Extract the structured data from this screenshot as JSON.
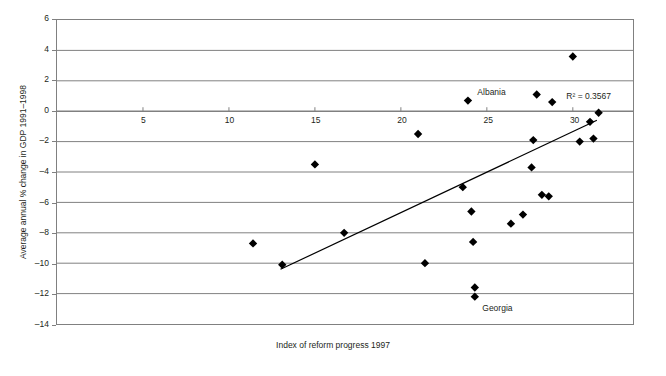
{
  "chart_data": {
    "type": "scatter",
    "title": "",
    "xlabel": "Index of reform progress 1997",
    "ylabel": "Average annual % change in GDP 1991–1998",
    "xlim": [
      0,
      33.5
    ],
    "ylim": [
      -14,
      6
    ],
    "xticks": [
      5,
      10,
      15,
      20,
      25,
      30
    ],
    "xtick_labels": [
      "5",
      "10",
      "15",
      "20",
      "25",
      "30"
    ],
    "yticks": [
      6,
      4,
      2,
      0,
      -2,
      -4,
      -6,
      -8,
      -10,
      -12,
      -14
    ],
    "ytick_labels": [
      "6",
      "4",
      "2",
      "0",
      "–2",
      "–4",
      "–6",
      "–8",
      "–10",
      "–12",
      "–14"
    ],
    "grid": "horizontal",
    "legend": "none",
    "marker": "diamond",
    "marker_color": "#000000",
    "grid_color": "#808080",
    "frame_color": "#808080",
    "points": [
      {
        "x": 11.4,
        "y": -8.7,
        "label": ""
      },
      {
        "x": 13.1,
        "y": -10.1,
        "label": ""
      },
      {
        "x": 15.0,
        "y": -3.5,
        "label": ""
      },
      {
        "x": 16.7,
        "y": -8.0,
        "label": ""
      },
      {
        "x": 21.0,
        "y": -1.5,
        "label": ""
      },
      {
        "x": 21.4,
        "y": -10.0,
        "label": ""
      },
      {
        "x": 23.6,
        "y": -5.0,
        "label": ""
      },
      {
        "x": 23.9,
        "y": 0.7,
        "label": "Albania"
      },
      {
        "x": 24.1,
        "y": -6.6,
        "label": ""
      },
      {
        "x": 24.2,
        "y": -8.6,
        "label": ""
      },
      {
        "x": 24.3,
        "y": -11.6,
        "label": ""
      },
      {
        "x": 24.3,
        "y": -12.2,
        "label": "Georgia"
      },
      {
        "x": 26.4,
        "y": -7.4,
        "label": ""
      },
      {
        "x": 27.1,
        "y": -6.8,
        "label": ""
      },
      {
        "x": 27.6,
        "y": -3.7,
        "label": ""
      },
      {
        "x": 27.7,
        "y": -1.9,
        "label": ""
      },
      {
        "x": 27.9,
        "y": 1.1,
        "label": ""
      },
      {
        "x": 28.2,
        "y": -5.5,
        "label": ""
      },
      {
        "x": 28.6,
        "y": -5.6,
        "label": ""
      },
      {
        "x": 28.8,
        "y": 0.6,
        "label": ""
      },
      {
        "x": 30.0,
        "y": 3.6,
        "label": ""
      },
      {
        "x": 30.4,
        "y": -2.0,
        "label": ""
      },
      {
        "x": 31.0,
        "y": -0.7,
        "label": ""
      },
      {
        "x": 31.2,
        "y": -1.8,
        "label": ""
      },
      {
        "x": 31.5,
        "y": -0.1,
        "label": ""
      }
    ],
    "trendline": {
      "x_start": 13.0,
      "y_start": -10.4,
      "x_end": 31.4,
      "y_end": -0.6,
      "color": "#000000",
      "width": 1.2
    },
    "annotations": [
      {
        "name": "r2-annotation",
        "text": "R² = 0.3567",
        "x": 30.1,
        "y": 1.0
      }
    ]
  },
  "axis_titles": {
    "x": "Index of reform progress 1997",
    "y": "Average annual % change in GDP 1991–1998"
  },
  "point_labels": {
    "albania": "Albania",
    "georgia": "Georgia"
  },
  "r2": {
    "text": "R² = 0.3567"
  }
}
